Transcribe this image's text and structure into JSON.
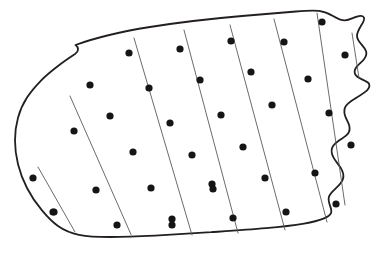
{
  "figure": {
    "type": "scientific-diagram",
    "subtype": "systematic-transect-sampling-plot",
    "background_color": "#ffffff",
    "width": 386,
    "height": 257
  },
  "region": {
    "name": "region-boundary",
    "stroke_color": "#231f20",
    "stroke_width": 1.8,
    "fill_color": "#ffffff",
    "outline_path": "M 75.5,45.0 C 96,37.5 122,31.5 150,27.0 C 180,22.2 212,18.6 242,16.0 C 262,14.3 281,12.8 296,11.5 C 305,10.7 313,10.2 319,10.9 C 325,11.6 329,13.6 333,16.0 C 337,18.4 341,20.6 345,20.4 C 349,20.2 353,17.8 357,16.6 C 360,15.7 363,15.9 364,17.6 C 365,19.6 363,22.6 361,25.8 C 359,29.2 357,32.6 357,35.8 C 357,39.0 359,41.6 361,43.8 C 363,46.2 365,48.4 366,51.0 C 367,53.8 366,56.6 364,59.2 C 362,61.8 359,64.0 357,66.4 C 355,68.8 354,71.4 355,73.8 C 356,76.2 359,78.0 362,79.4 C 365,80.8 368,82.0 369,83.8 C 370,85.8 369,88.2 367,90.4 C 364,93.2 360,95.6 356,98.0 C 352,100.4 348,102.8 346,105.8 C 344,108.8 344,112.2 345,115.4 C 346,118.8 348,121.8 349,124.8 C 350,128.0 350,131.0 348,133.6 C 346,136.4 342,138.4 339,140.6 C 336,142.8 333,145.2 332,148.2 C 331,151.4 332,155.0 334,158.4 C 336,161.8 339,165.0 341,168.4 C 343,171.8 344,175.4 343,178.8 C 342,182.4 339,185.4 336,188.2 C 333,191.0 330,193.6 329,196.6 C 328,199.6 329,202.8 330,205.6 C 331,208.4 332,211.0 331,213.2 C 330,215.6 327,217.2 324,218.4 C 318,220.8 311,222.4 304,223.6 C 292,225.6 279,227.0 266,228.2 C 248,229.8 229,231.0 211,232.2 C 192,233.4 173,234.6 155,235.6 C 139,236.4 124,237.0 110,237.0 C 99,237.0 88,236.6 79,234.8 C 71,233.2 64,230.2 58,226.0 C 52,221.8 47,216.4 42,210.4 C 36,203.4 31,195.8 27,188.0 C 23,180.2 20,172.2 18,164.2 C 16,156.2 15,148.2 15,140.4 C 15,132.6 16,125.0 18,117.8 C 20,110.6 23,103.8 27,97.6 C 31,91.4 36,85.8 41,80.6 C 46,75.4 52,70.6 58,66.0 C 63,62.0 69,58.0 75,54.0 C 77,52.6 78,51.0 78,49.4 C 78,47.6 77,46.0 75.5,45.0 Z",
    "edge_features": [
      "smooth-curved-top-edge",
      "wavy-notched-right-edge",
      "undulating-bottom-edge",
      "rounded-left-edge"
    ]
  },
  "transects": {
    "name": "transect-lines",
    "count": 8,
    "stroke_color": "#5a5a5a",
    "stroke_width": 0.9,
    "orientation": "upper-right to lower-left",
    "angle_degrees": 61,
    "lines": [
      {
        "id": "transect-1",
        "x1": 38.0,
        "y1": 167.0,
        "x2": 75.0,
        "y2": 232.0,
        "dots": 2
      },
      {
        "id": "transect-2",
        "x1": 70.0,
        "y1": 96.0,
        "x2": 131.0,
        "y2": 234.5,
        "dots": 5
      },
      {
        "id": "transect-3",
        "x1": 134.0,
        "y1": 38.0,
        "x2": 192.0,
        "y2": 235.0,
        "dots": 6
      },
      {
        "id": "transect-4",
        "x1": 184.0,
        "y1": 30.0,
        "x2": 238.0,
        "y2": 233.0,
        "dots": 5
      },
      {
        "id": "transect-5",
        "x1": 230.0,
        "y1": 25.0,
        "x2": 285.0,
        "y2": 230.0,
        "dots": 5
      },
      {
        "id": "transect-6",
        "x1": 274.0,
        "y1": 19.0,
        "x2": 327.0,
        "y2": 222.0,
        "dots": 5
      },
      {
        "id": "transect-7",
        "x1": 317.0,
        "y1": 13.0,
        "x2": 345.0,
        "y2": 205.0,
        "dots": 5
      },
      {
        "id": "transect-8",
        "x1": 352.0,
        "y1": 33.0,
        "x2": 359.0,
        "y2": 78.0,
        "dots": 2
      }
    ]
  },
  "sample_points": {
    "name": "sample-point-markers",
    "marker_shape": "filled-circle",
    "fill_color": "#151515",
    "radius": 3.6,
    "total_count": 35,
    "points": [
      {
        "id": "p1",
        "x": 33.0,
        "y": 178.0,
        "transect": 1
      },
      {
        "id": "p2",
        "x": 53.0,
        "y": 212.0,
        "transect": 1
      },
      {
        "id": "p3",
        "x": 90.0,
        "y": 85.0,
        "transect": 2
      },
      {
        "id": "p4",
        "x": 74.0,
        "y": 131.0,
        "transect": 2
      },
      {
        "id": "p5",
        "x": 96.0,
        "y": 190.0,
        "transect": 2
      },
      {
        "id": "p6",
        "x": 54.0,
        "y": 212.0,
        "transect": 2
      },
      {
        "id": "p7",
        "x": 117.0,
        "y": 225.0,
        "transect": 2
      },
      {
        "id": "p8",
        "x": 129.0,
        "y": 53.0,
        "transect": 3
      },
      {
        "id": "p9",
        "x": 110.0,
        "y": 116.0,
        "transect": 3
      },
      {
        "id": "p10",
        "x": 133.0,
        "y": 152.0,
        "transect": 3
      },
      {
        "id": "p11",
        "x": 151.0,
        "y": 188.0,
        "transect": 3
      },
      {
        "id": "p12",
        "x": 172.0,
        "y": 225.0,
        "transect": 3
      },
      {
        "id": "p13",
        "x": 149.0,
        "y": 88.0,
        "transect": 3
      },
      {
        "id": "p14",
        "x": 180.0,
        "y": 49.0,
        "transect": 4
      },
      {
        "id": "p15",
        "x": 200.0,
        "y": 80.0,
        "transect": 4
      },
      {
        "id": "p16",
        "x": 170.0,
        "y": 123.0,
        "transect": 4
      },
      {
        "id": "p17",
        "x": 192.0,
        "y": 155.0,
        "transect": 4
      },
      {
        "id": "p18",
        "x": 213.0,
        "y": 189.0,
        "transect": 4
      },
      {
        "id": "p19",
        "x": 172.0,
        "y": 219.0,
        "transect": 4
      },
      {
        "id": "p20",
        "x": 231.0,
        "y": 41.0,
        "transect": 5
      },
      {
        "id": "p21",
        "x": 251.0,
        "y": 72.0,
        "transect": 5
      },
      {
        "id": "p22",
        "x": 221.0,
        "y": 115.0,
        "transect": 5
      },
      {
        "id": "p23",
        "x": 243.0,
        "y": 147.0,
        "transect": 5
      },
      {
        "id": "p24",
        "x": 212.0,
        "y": 184.0,
        "transect": 5
      },
      {
        "id": "p25",
        "x": 233.0,
        "y": 218.0,
        "transect": 5
      },
      {
        "id": "p26",
        "x": 284.0,
        "y": 42.0,
        "transect": 6
      },
      {
        "id": "p27",
        "x": 272.0,
        "y": 105.0,
        "transect": 6
      },
      {
        "id": "p28",
        "x": 265.0,
        "y": 178.0,
        "transect": 6
      },
      {
        "id": "p29",
        "x": 286.0,
        "y": 212.0,
        "transect": 6
      },
      {
        "id": "p30",
        "x": 322.0,
        "y": 22.0,
        "transect": 7
      },
      {
        "id": "p31",
        "x": 308.0,
        "y": 79.0,
        "transect": 7
      },
      {
        "id": "p32",
        "x": 329.0,
        "y": 113.0,
        "transect": 7
      },
      {
        "id": "p33",
        "x": 315.0,
        "y": 173.0,
        "transect": 7
      },
      {
        "id": "p34",
        "x": 336.0,
        "y": 204.0,
        "transect": 7
      },
      {
        "id": "p35",
        "x": 345.0,
        "y": 55.0,
        "transect": 8
      },
      {
        "id": "p36",
        "x": 351.0,
        "y": 145.0,
        "transect": 8
      }
    ]
  }
}
